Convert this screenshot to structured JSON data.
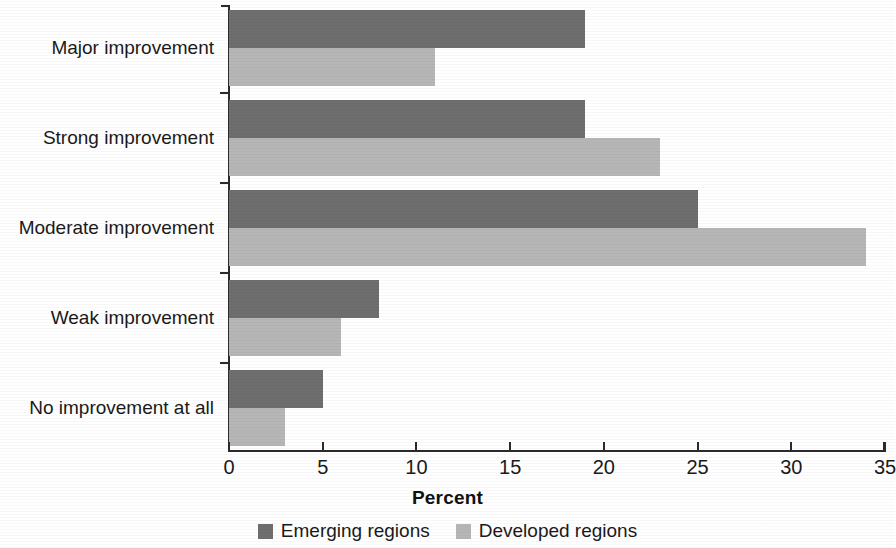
{
  "chart_data": {
    "type": "bar",
    "orientation": "horizontal",
    "title": "",
    "xlabel": "Percent",
    "ylabel": "",
    "xlim": [
      0,
      35
    ],
    "xticks": [
      0,
      5,
      10,
      15,
      20,
      25,
      30,
      35
    ],
    "xtick_labels": [
      "0",
      "5",
      "10",
      "15",
      "20",
      "25",
      "30",
      "35"
    ],
    "grid": false,
    "legend_position": "bottom",
    "categories": [
      "Major improvement",
      "Strong improvement",
      "Moderate improvement",
      "Weak improvement",
      "No improvement at all"
    ],
    "series": [
      {
        "name": "Emerging regions",
        "color": "#6e6e6e",
        "values": [
          19,
          19,
          25,
          8,
          5
        ]
      },
      {
        "name": "Developed regions",
        "color": "#b6b6b6",
        "values": [
          11,
          23,
          34,
          6,
          3
        ]
      }
    ]
  },
  "colors": {
    "emerging": "#6e6e6e",
    "developed": "#b6b6b6",
    "axis": "#2b2b2b",
    "text": "#1a1a1a",
    "background": "#ffffff"
  }
}
